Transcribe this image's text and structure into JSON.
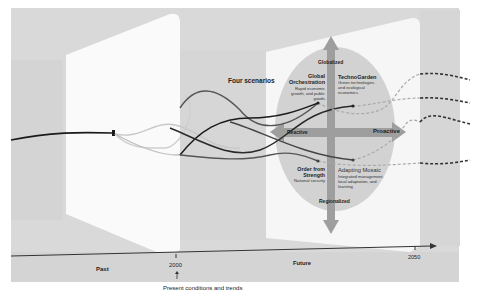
{
  "diagram": {
    "title": "Four scenarios",
    "timeline": {
      "labels": {
        "past": "Past",
        "future": "Future",
        "year_2000": "2000",
        "year_2050": "2050",
        "present_note": "Present conditions and trends"
      }
    },
    "axes": {
      "top": "Globalized",
      "bottom": "Regionalized",
      "left": "Reactive",
      "right": "Proactive"
    },
    "scenarios": [
      {
        "name": "Global Orchestration",
        "description": "Rapid economic growth, and public goods",
        "quadrant": "globalized-reactive"
      },
      {
        "name": "TechnoGarden",
        "description": "Green technologies and ecological economics",
        "quadrant": "globalized-proactive"
      },
      {
        "name": "Order from Strength",
        "description": "National security",
        "quadrant": "regionalized-reactive"
      },
      {
        "name": "Adapting Mosaic",
        "description": "Integrated management, local adaptation, and learning",
        "quadrant": "regionalized-proactive"
      }
    ],
    "colors": {
      "background_band": "#d9d9d9",
      "panel": "#f7f7f7",
      "ellipse": "#cfcfcf",
      "axis_arrow": "#9a9a9a",
      "timeline": "#333333",
      "path_dark": "#1a1a1a",
      "path_mid": "#555555",
      "path_light": "#c4c4c4",
      "dashed": "#444444"
    }
  }
}
